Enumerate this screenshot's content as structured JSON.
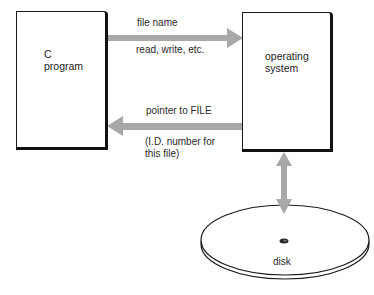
{
  "diagram": {
    "nodes": {
      "c_program": {
        "label": "C\nprogram"
      },
      "operating_system": {
        "label": "operating\nsystem"
      },
      "disk": {
        "label": "disk"
      }
    },
    "edges": {
      "request": {
        "from": "C program",
        "to": "operating system",
        "label_above": "file name",
        "label_below": "read, write, etc."
      },
      "response": {
        "from": "operating system",
        "to": "C program",
        "label_above": "pointer to FILE",
        "label_below": "(I.D. number for\nthis file)"
      },
      "disk_io": {
        "from": "operating system",
        "to": "disk",
        "bidirectional": true
      }
    },
    "colors": {
      "arrow": "#a8a8a8",
      "box_border": "#1a1a1a",
      "background": "#ffffff"
    }
  }
}
